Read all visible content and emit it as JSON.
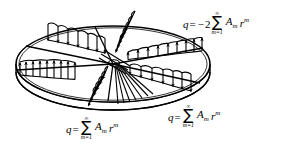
{
  "figure": {
    "stroke_color": "#000000",
    "fill_color": "#ffffff",
    "background": "#ffffff"
  },
  "plate": {
    "name": "circular-plate",
    "center_x": 113,
    "center_y": 64,
    "radius_x": 97,
    "radius_y": 38,
    "thickness": 9
  },
  "radials": [
    {
      "name": "radial-upper-left",
      "angle_deg": 208,
      "arrow_dir": "down",
      "count": 7
    },
    {
      "name": "radial-left",
      "angle_deg": 172,
      "arrow_dir": "up",
      "count": 9
    },
    {
      "name": "radial-upper-right",
      "angle_deg": 352,
      "arrow_dir": "up",
      "count": 9
    },
    {
      "name": "radial-lower-right",
      "angle_deg": 28,
      "arrow_dir": "down",
      "count": 7
    },
    {
      "name": "radial-top-vertical",
      "angle_deg": 272,
      "arrow_dir": "down",
      "count": 6
    },
    {
      "name": "radial-bottom-vertical",
      "angle_deg": 92,
      "arrow_dir": "down",
      "count": 6
    },
    {
      "name": "radial-fan-lower",
      "angle_deg": 70,
      "arrow_dir": "none",
      "count": 7
    }
  ],
  "equations": {
    "top_right": {
      "name": "equation-top-right",
      "lhs": "q",
      "equals": "=",
      "sign": "−",
      "coefficient": "2",
      "sigma": "∑",
      "upper_limit": "∞",
      "lower_limit": "m=1",
      "term_base": "A",
      "term_sub": "m",
      "factor_base": "r",
      "factor_sup": "m",
      "plain": "q = −2∑(m=1 to ∞) A_m r^m"
    },
    "bottom_left": {
      "name": "equation-bottom-left",
      "lhs": "q",
      "equals": "=",
      "sign": "",
      "coefficient": "",
      "sigma": "∑",
      "upper_limit": "∞",
      "lower_limit": "m=1",
      "term_base": "A",
      "term_sub": "m",
      "factor_base": "r",
      "factor_sup": "m",
      "plain": "q = ∑(m=1 to ∞) A_m r^m"
    },
    "bottom_right": {
      "name": "equation-bottom-right",
      "lhs": "q",
      "equals": "=",
      "sign": "",
      "coefficient": "",
      "sigma": "∑",
      "upper_limit": "∞",
      "lower_limit": "m=1",
      "term_base": "A",
      "term_sub": "m",
      "factor_base": "r",
      "factor_sup": "m",
      "plain": "q = ∑(m=1 to ∞) A_m r^m"
    }
  }
}
